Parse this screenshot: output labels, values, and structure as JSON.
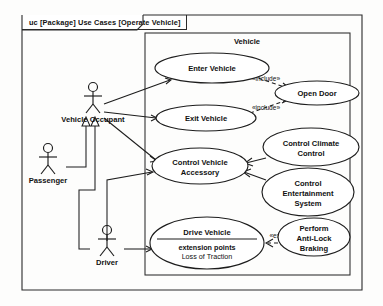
{
  "diagram": {
    "kind": "uc",
    "header": "uc [Package] Use Cases [Operate Vehicle]",
    "header_prefix": "uc",
    "header_body": "[Package] Use Cases [Operate Vehicle]",
    "boundary_label": "Vehicle",
    "stroke_color": "#1d1d1d",
    "background_color": "#fdfdfc"
  },
  "actors": [
    {
      "id": "vehicle-occupant",
      "label": "Vehicle Occupant",
      "cx": 93,
      "cy": 108
    },
    {
      "id": "passenger",
      "label": "Passenger",
      "cx": 48,
      "cy": 167
    },
    {
      "id": "driver",
      "label": "Driver",
      "cx": 107,
      "cy": 249
    }
  ],
  "use_cases": [
    {
      "id": "enter-vehicle",
      "label": "Enter Vehicle",
      "cx": 212,
      "cy": 68,
      "rx": 57,
      "ry": 15
    },
    {
      "id": "open-door",
      "label": "Open Door",
      "cx": 317,
      "cy": 93,
      "rx": 42,
      "ry": 12
    },
    {
      "id": "exit-vehicle",
      "label": "Exit Vehicle",
      "cx": 206,
      "cy": 118,
      "rx": 50,
      "ry": 13
    },
    {
      "id": "control-vehicle-accessory",
      "label_lines": [
        "Control Vehicle",
        "Accessory"
      ],
      "cx": 200,
      "cy": 166,
      "rx": 48,
      "ry": 18
    },
    {
      "id": "control-climate-control",
      "label_lines": [
        "Control Climate",
        "Control"
      ],
      "cx": 311,
      "cy": 147,
      "rx": 48,
      "ry": 19
    },
    {
      "id": "control-entertainment-system",
      "label_lines": [
        "Control",
        "Entertainment",
        "System"
      ],
      "cx": 308,
      "cy": 192,
      "rx": 46,
      "ry": 24
    },
    {
      "id": "perform-anti-lock-braking",
      "label_lines": [
        "Perform",
        "Anti-Lock",
        "Braking"
      ],
      "cx": 314,
      "cy": 237,
      "rx": 36,
      "ry": 19
    }
  ],
  "drive_vehicle": {
    "id": "drive-vehicle",
    "title": "Drive Vehicle",
    "extension_points_label": "extension points",
    "extension_point": "Loss of Traction",
    "cx": 207,
    "cy": 243,
    "rx": 57,
    "ry": 26
  },
  "relationships": [
    {
      "id": "include-enter-open",
      "stereotype": "«include»",
      "label_x": 266,
      "label_y": 81
    },
    {
      "id": "include-exit-open",
      "stereotype": "«include»",
      "label_x": 266,
      "label_y": 110
    },
    {
      "id": "extend-antilock-drive",
      "stereotype": "«extend»",
      "label_x": 281,
      "label_y": 238
    }
  ]
}
